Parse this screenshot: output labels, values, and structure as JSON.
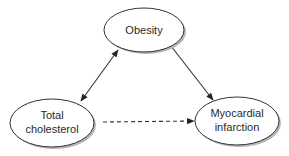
{
  "diagram": {
    "type": "causal-dag",
    "nodes": [
      {
        "id": "obesity",
        "lines": [
          "Obesity"
        ],
        "cx": 144,
        "cy": 30,
        "rx": 40,
        "ry": 22
      },
      {
        "id": "total-cholesterol",
        "lines": [
          "Total",
          "cholesterol"
        ],
        "cx": 52,
        "cy": 123,
        "rx": 42,
        "ry": 24
      },
      {
        "id": "myocardial-infarction",
        "lines": [
          "Myocardial",
          "infarction"
        ],
        "cx": 237,
        "cy": 121,
        "rx": 42,
        "ry": 24
      }
    ],
    "edges": [
      {
        "from": "total-cholesterol",
        "to": "obesity",
        "style": "solid",
        "direction": "both"
      },
      {
        "from": "obesity",
        "to": "myocardial-infarction",
        "style": "solid",
        "direction": "forward"
      },
      {
        "from": "total-cholesterol",
        "to": "myocardial-infarction",
        "style": "dashed",
        "direction": "forward"
      }
    ],
    "colors": {
      "stroke": "#333333",
      "fill": "#ffffff",
      "shadow": "#b5b5b5",
      "text": "#2a2a2a"
    }
  }
}
